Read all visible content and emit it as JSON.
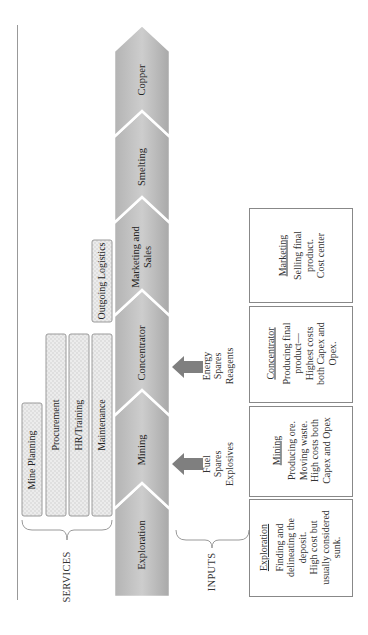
{
  "diagram": {
    "stages": [
      {
        "id": "exploration",
        "label": "Exploration"
      },
      {
        "id": "mining",
        "label": "Mining"
      },
      {
        "id": "concentrator",
        "label": "Concentrator"
      },
      {
        "id": "marketing",
        "label": "Marketing and\nSales"
      },
      {
        "id": "smelting",
        "label": "Smelting"
      },
      {
        "id": "copper",
        "label": "Copper"
      }
    ],
    "services": {
      "label": "SERVICES",
      "items": [
        {
          "id": "mine-planning",
          "label": "Mine Planning"
        },
        {
          "id": "procurement",
          "label": "Procurement"
        },
        {
          "id": "hr-training",
          "label": "HR/Training"
        },
        {
          "id": "maintenance",
          "label": "Maintenance"
        },
        {
          "id": "outgoing-logistics",
          "label": "Outgoing Logistics"
        }
      ]
    },
    "inputs": {
      "label": "INPUTS",
      "groups": [
        {
          "target": "mining",
          "lines": [
            "Fuel",
            "Spares",
            "Explosives"
          ]
        },
        {
          "target": "concentrator",
          "lines": [
            "Energy",
            "Spares",
            "Reagents"
          ]
        }
      ]
    },
    "descriptions": [
      {
        "id": "exploration",
        "title": "Exploration",
        "body": "Finding and\ndelineating the\ndeposit.\nHigh cost but\nusually considered\nsunk."
      },
      {
        "id": "mining",
        "title": "Mining",
        "body": "Producing ore.\nMoving waste.\nHigh costs both\nCapex and Opex"
      },
      {
        "id": "concentrator",
        "title": "Concentrator",
        "body": "Producing final\nproduct—\nHighest costs\nboth Capex and\nOpex."
      },
      {
        "id": "marketing",
        "title": "Marketing",
        "body": "Selling final\nproduct.\nCost center"
      }
    ],
    "colors": {
      "chevron_light": "#c8c8c8",
      "chevron_dark": "#a9a9a9",
      "service_fill": "#e2e2e2",
      "arrow": "#7f7f7f",
      "line": "#8a8a8a"
    }
  }
}
